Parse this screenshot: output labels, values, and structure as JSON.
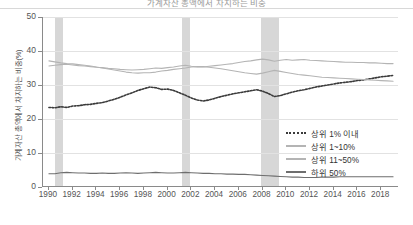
{
  "chart_data": {
    "type": "line",
    "title": "가계자산 총액에서 차지하는 비중",
    "xlabel": "",
    "ylabel": "가계자산 총액에서 차지하는 비중(%)",
    "ylim": [
      0,
      50
    ],
    "xlim": [
      1989.5,
      2019.5
    ],
    "grid": true,
    "legend_position": "bottom-right",
    "yticks": [
      "0",
      "10",
      "20",
      "30",
      "40",
      "50"
    ],
    "xticks": [
      "1990",
      "1992",
      "1994",
      "1996",
      "1998",
      "2000",
      "2002",
      "2004",
      "2006",
      "2008",
      "2010",
      "2012",
      "2014",
      "2016",
      "2018"
    ],
    "recession_bands": [
      {
        "start": 1990.5,
        "end": 1991.2
      },
      {
        "start": 2001.2,
        "end": 2001.9
      },
      {
        "start": 2007.9,
        "end": 2009.4
      }
    ],
    "series": [
      {
        "name": "상위 1% 이내",
        "style": "dotted",
        "color": "#3b3b3b",
        "x": [
          1990,
          1990.5,
          1991,
          1991.5,
          1992,
          1992.5,
          1993,
          1993.5,
          1994,
          1994.5,
          1995,
          1995.5,
          1996,
          1996.5,
          1997,
          1997.5,
          1998,
          1998.5,
          1999,
          1999.5,
          2000,
          2000.5,
          2001,
          2001.5,
          2002,
          2002.5,
          2003,
          2003.5,
          2004,
          2004.5,
          2005,
          2005.5,
          2006,
          2006.5,
          2007,
          2007.5,
          2008,
          2008.5,
          2009,
          2009.5,
          2010,
          2010.5,
          2011,
          2011.5,
          2012,
          2012.5,
          2013,
          2013.5,
          2014,
          2014.5,
          2015,
          2015.5,
          2016,
          2016.5,
          2017,
          2017.5,
          2018,
          2018.5,
          2019
        ],
        "values": [
          23.4,
          23.3,
          23.6,
          23.4,
          23.8,
          23.9,
          24.2,
          24.3,
          24.6,
          24.8,
          25.3,
          25.8,
          26.4,
          27.1,
          27.7,
          28.4,
          28.9,
          29.4,
          29.2,
          28.7,
          28.8,
          28.4,
          27.7,
          27.0,
          26.2,
          25.6,
          25.3,
          25.6,
          26.1,
          26.6,
          27.0,
          27.4,
          27.7,
          28.0,
          28.3,
          28.6,
          28.2,
          27.5,
          26.6,
          26.9,
          27.4,
          27.9,
          28.3,
          28.6,
          29.0,
          29.4,
          29.7,
          30.0,
          30.3,
          30.6,
          30.8,
          31.0,
          31.3,
          31.5,
          31.8,
          32.1,
          32.4,
          32.6,
          32.8
        ]
      },
      {
        "name": "상위 1~10%",
        "style": "solid",
        "color": "#b4b4b4",
        "x": [
          1990,
          1990.5,
          1991,
          1991.5,
          1992,
          1992.5,
          1993,
          1993.5,
          1994,
          1994.5,
          1995,
          1995.5,
          1996,
          1996.5,
          1997,
          1997.5,
          1998,
          1998.5,
          1999,
          1999.5,
          2000,
          2000.5,
          2001,
          2001.5,
          2002,
          2002.5,
          2003,
          2003.5,
          2004,
          2004.5,
          2005,
          2005.5,
          2006,
          2006.5,
          2007,
          2007.5,
          2008,
          2008.5,
          2009,
          2009.5,
          2010,
          2010.5,
          2011,
          2011.5,
          2012,
          2012.5,
          2013,
          2013.5,
          2014,
          2014.5,
          2015,
          2015.5,
          2016,
          2016.5,
          2017,
          2017.5,
          2018,
          2018.5,
          2019
        ],
        "values": [
          35.6,
          35.8,
          36.0,
          36.1,
          35.9,
          35.7,
          35.6,
          35.4,
          35.2,
          35.1,
          34.9,
          34.8,
          34.6,
          34.5,
          34.4,
          34.5,
          34.6,
          34.8,
          35.0,
          34.9,
          35.1,
          35.3,
          35.6,
          35.8,
          35.5,
          35.3,
          35.3,
          35.5,
          35.7,
          35.9,
          36.1,
          36.3,
          36.6,
          36.9,
          37.1,
          37.4,
          37.6,
          37.4,
          37.0,
          37.3,
          37.5,
          37.3,
          37.4,
          37.5,
          37.3,
          37.2,
          37.1,
          37.0,
          36.9,
          36.8,
          36.7,
          36.7,
          36.6,
          36.6,
          36.5,
          36.5,
          36.4,
          36.3,
          36.3
        ]
      },
      {
        "name": "상위 11~50%",
        "style": "solid",
        "color": "#b4b4b4",
        "x": [
          1990,
          1990.5,
          1991,
          1991.5,
          1992,
          1992.5,
          1993,
          1993.5,
          1994,
          1994.5,
          1995,
          1995.5,
          1996,
          1996.5,
          1997,
          1997.5,
          1998,
          1998.5,
          1999,
          1999.5,
          2000,
          2000.5,
          2001,
          2001.5,
          2002,
          2002.5,
          2003,
          2003.5,
          2004,
          2004.5,
          2005,
          2005.5,
          2006,
          2006.5,
          2007,
          2007.5,
          2008,
          2008.5,
          2009,
          2009.5,
          2010,
          2010.5,
          2011,
          2011.5,
          2012,
          2012.5,
          2013,
          2013.5,
          2014,
          2014.5,
          2015,
          2015.5,
          2016,
          2016.5,
          2017,
          2017.5,
          2018,
          2018.5,
          2019
        ],
        "values": [
          37.1,
          36.8,
          36.5,
          36.3,
          36.2,
          36.0,
          35.8,
          35.6,
          35.3,
          35.0,
          34.7,
          34.4,
          34.1,
          33.8,
          33.6,
          33.5,
          33.6,
          33.6,
          33.8,
          34.1,
          34.3,
          34.6,
          34.8,
          35.0,
          35.3,
          35.4,
          35.4,
          35.2,
          35.0,
          34.8,
          34.5,
          34.2,
          33.9,
          33.6,
          33.4,
          33.2,
          33.5,
          33.9,
          34.3,
          34.0,
          33.7,
          33.4,
          33.1,
          32.9,
          32.7,
          32.5,
          32.3,
          32.2,
          32.1,
          32.0,
          31.9,
          31.8,
          31.7,
          31.6,
          31.5,
          31.4,
          31.3,
          31.2,
          31.1
        ]
      },
      {
        "name": "하위 50%",
        "style": "solid",
        "color": "#6e6e6e",
        "x": [
          1990,
          1990.5,
          1991,
          1991.5,
          1992,
          1992.5,
          1993,
          1993.5,
          1994,
          1994.5,
          1995,
          1995.5,
          1996,
          1996.5,
          1997,
          1997.5,
          1998,
          1998.5,
          1999,
          1999.5,
          2000,
          2000.5,
          2001,
          2001.5,
          2002,
          2002.5,
          2003,
          2003.5,
          2004,
          2004.5,
          2005,
          2005.5,
          2006,
          2006.5,
          2007,
          2007.5,
          2008,
          2008.5,
          2009,
          2009.5,
          2010,
          2010.5,
          2011,
          2011.5,
          2012,
          2012.5,
          2013,
          2013.5,
          2014,
          2014.5,
          2015,
          2015.5,
          2016,
          2016.5,
          2017,
          2017.5,
          2018,
          2018.5,
          2019
        ],
        "values": [
          3.9,
          3.9,
          4.2,
          4.3,
          4.2,
          4.1,
          4.1,
          4.0,
          4.0,
          4.1,
          4.0,
          4.0,
          4.1,
          4.2,
          4.1,
          4.0,
          4.1,
          4.2,
          4.3,
          4.2,
          4.1,
          4.1,
          4.2,
          4.3,
          4.2,
          4.1,
          4.0,
          4.0,
          3.9,
          3.9,
          3.8,
          3.8,
          3.7,
          3.7,
          3.6,
          3.5,
          3.4,
          3.3,
          3.2,
          3.1,
          3.0,
          2.9,
          2.9,
          2.8,
          2.8,
          2.8,
          2.9,
          2.9,
          2.9,
          3.0,
          3.0,
          3.0,
          3.0,
          3.0,
          3.0,
          3.0,
          3.0,
          3.0,
          3.0
        ]
      }
    ]
  },
  "legend": {
    "items": [
      {
        "label": "상위 1% 이내"
      },
      {
        "label": "상위 1~10%"
      },
      {
        "label": "상위 11~50%"
      },
      {
        "label": "하위 50%"
      }
    ]
  }
}
